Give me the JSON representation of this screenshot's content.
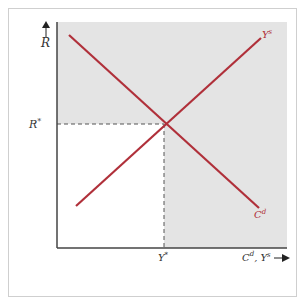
{
  "diagram": {
    "type": "supply-demand-equilibrium",
    "y_axis": {
      "label": "R",
      "arrow": "up"
    },
    "x_axis": {
      "label_main": "C",
      "label_main_sup": "d",
      "label_sep": ", Y",
      "label_sep_sup": "s",
      "arrow": "right"
    },
    "equilibrium": {
      "r_label": "R",
      "r_sup": "*",
      "y_label": "Y",
      "y_sup": "*"
    },
    "curves": [
      {
        "name": "Ys",
        "label": "Y",
        "label_sup": "s",
        "slope": "upward",
        "color": "#b0303a"
      },
      {
        "name": "Cd",
        "label": "C",
        "label_sup": "d",
        "slope": "downward",
        "color": "#b0303a"
      }
    ],
    "colors": {
      "shaded_region": "#e4e4e4",
      "axes": "#444444",
      "curves": "#b0303a",
      "guides": "#555555"
    }
  }
}
